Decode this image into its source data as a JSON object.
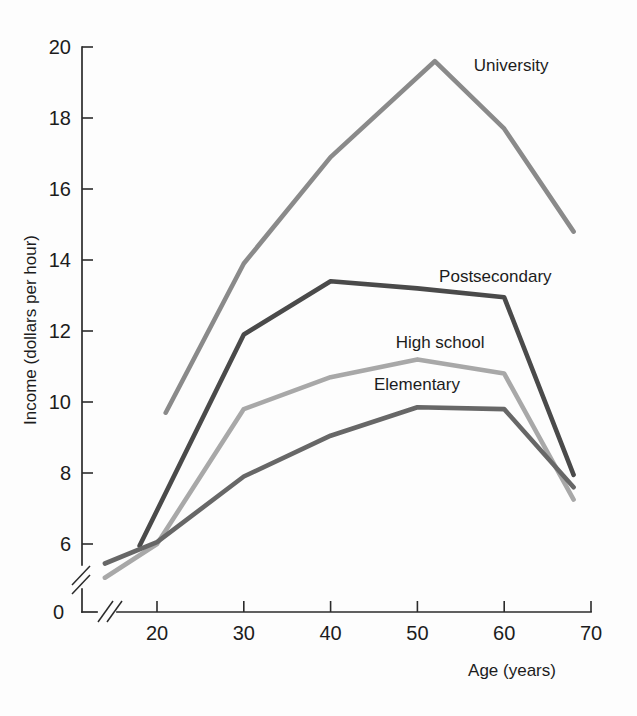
{
  "chart_data": {
    "type": "line",
    "title": "",
    "xlabel": "Age (years)",
    "ylabel": "Income (dollars per hour)",
    "xlim": [
      13,
      72
    ],
    "ylim": [
      4.5,
      20
    ],
    "xticks": [
      20,
      30,
      40,
      50,
      60,
      70
    ],
    "yticks": [
      0,
      6,
      8,
      10,
      12,
      14,
      16,
      18,
      20
    ],
    "xtick_labels": [
      "20",
      "30",
      "40",
      "50",
      "60",
      "70"
    ],
    "ytick_labels": [
      "0",
      "6",
      "8",
      "10",
      "12",
      "14",
      "16",
      "18",
      "20"
    ],
    "grid": false,
    "legend_position": "inline-end-labels",
    "axis_break_x": true,
    "axis_break_y": true,
    "series": [
      {
        "name": "University",
        "color": "#8a8a8a",
        "label": "University",
        "label_x": 56.5,
        "label_y": 19.5,
        "x": [
          21,
          30,
          40,
          52,
          60,
          68
        ],
        "values": [
          9.7,
          13.9,
          16.9,
          19.6,
          17.7,
          14.8
        ]
      },
      {
        "name": "Postsecondary",
        "color": "#4a4a4a",
        "label": "Postsecondary",
        "label_x": 52.5,
        "label_y": 13.55,
        "x": [
          18,
          30,
          40,
          50,
          60,
          68
        ],
        "values": [
          5.95,
          11.9,
          13.4,
          13.2,
          12.95,
          7.95
        ]
      },
      {
        "name": "High school",
        "color": "#a8a8a8",
        "label": "High school",
        "label_x": 47.5,
        "label_y": 11.7,
        "x": [
          14,
          20,
          30,
          40,
          50,
          60,
          68
        ],
        "values": [
          5.05,
          6.0,
          9.8,
          10.7,
          11.2,
          10.8,
          7.25
        ]
      },
      {
        "name": "Elementary",
        "color": "#676767",
        "label": "Elementary",
        "label_x": 45.0,
        "label_y": 10.5,
        "x": [
          14,
          20,
          30,
          40,
          50,
          60,
          68
        ],
        "values": [
          5.45,
          6.05,
          7.9,
          9.05,
          9.85,
          9.8,
          7.6
        ]
      }
    ]
  }
}
